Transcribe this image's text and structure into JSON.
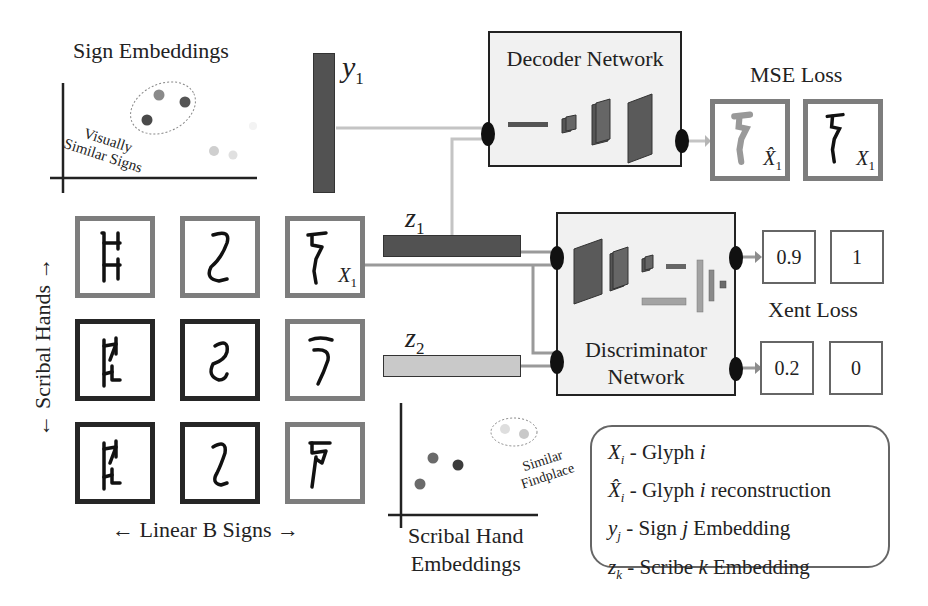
{
  "sign_embeddings": {
    "title": "Sign Embeddings",
    "annotation_line1": "Visually",
    "annotation_line2": "Similar Signs"
  },
  "scribe_embeddings": {
    "title_line1": "Scribal Hand",
    "title_line2": "Embeddings",
    "annotation_line1": "Similar",
    "annotation_line2": "Findplace"
  },
  "vectors": {
    "y1": {
      "base": "y",
      "sub": "1"
    },
    "z1": {
      "base": "z",
      "sub": "1"
    },
    "z2": {
      "base": "z",
      "sub": "2"
    }
  },
  "decoder": {
    "label": "Decoder Network"
  },
  "discriminator": {
    "label_line1": "Discriminator",
    "label_line2": "Network"
  },
  "mse": {
    "title": "MSE Loss",
    "reconstruction_label": {
      "base": "X̂",
      "sub": "1"
    },
    "original_label": {
      "base": "X",
      "sub": "1"
    }
  },
  "xent": {
    "title": "Xent Loss",
    "real": {
      "prediction": "0.9",
      "target": "1"
    },
    "fake": {
      "prediction": "0.2",
      "target": "0"
    }
  },
  "grid": {
    "x_axis_label": "← Linear B Signs →",
    "y_axis_label": "← Scribal Hands →",
    "highlight_label": {
      "base": "X",
      "sub": "1"
    },
    "rows": [
      {
        "frame": "gray",
        "glyphs": [
          "ladder-sign",
          "s-curve-sign",
          "hook-sign"
        ]
      },
      {
        "frame": "dark",
        "glyphs": [
          "ladder-sign",
          "s-curve-sign",
          "hook-sign"
        ],
        "last_frame": "gray"
      },
      {
        "frame": "dark",
        "glyphs": [
          "ladder-sign",
          "s-curve-sign",
          "hook-sign"
        ],
        "last_frame": "gray"
      }
    ]
  },
  "legend": {
    "items": [
      {
        "symbol": "X",
        "sub": "i",
        "text": " - Glyph ",
        "var": "i",
        "rest": ""
      },
      {
        "symbol": "X̂",
        "sub": "i",
        "text": " - Glyph ",
        "var": "i",
        "rest": " reconstruction"
      },
      {
        "symbol": "y",
        "sub": "j",
        "text": " - Sign ",
        "var": "j",
        "rest": " Embedding"
      },
      {
        "symbol": "z",
        "sub": "k",
        "text": " - Scribe ",
        "var": "k",
        "rest": " Embedding"
      }
    ]
  },
  "colors": {
    "dark_vector": "#525252",
    "light_vector": "#c9c9c9",
    "connector": "#b3b3b3",
    "connector_dark": "#8c8c8c",
    "box_fill": "#f1f1f1"
  }
}
